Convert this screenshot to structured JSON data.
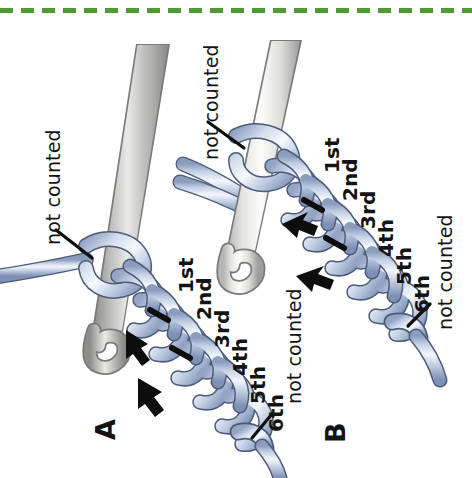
{
  "figure": {
    "kind": "crochet-instruction-illustration",
    "orientation_note": "all text rendered rotated 90 degrees counter-clockwise",
    "background_color": "#ffffff",
    "ink_color": "#131313"
  },
  "top_rule": {
    "name": "green-dashed-divider",
    "color": "#4f9b33",
    "dash_length_px": 13,
    "gap_length_px": 8,
    "y_px": 8
  },
  "palette": {
    "yarn_light": "#eef2f9",
    "yarn_mid": "#b9c6de",
    "yarn_dark": "#6d7fa2",
    "yarn_outline": "#4d5b78",
    "hook_light": "#fdfdfd",
    "hook_mid": "#d8d8d6",
    "hook_dark": "#8e8e8c",
    "hook_outline": "#7a7a78",
    "arrow": "#0d0d0d",
    "green": "#4f9b33"
  },
  "panels": [
    {
      "id": "A",
      "label": "A",
      "hook": {
        "name": "crochet-hook",
        "shade": "gray"
      },
      "not_counted_labels": [
        {
          "id": "a-top",
          "text": "not counted",
          "points_at": "loop-on-hook"
        },
        {
          "id": "a-bottom",
          "text": "not counted",
          "points_at": "slip-knot"
        }
      ],
      "stitch_labels": [
        "1st",
        "2nd",
        "3rd",
        "4th",
        "5th",
        "6th"
      ],
      "arrows": [
        {
          "id": "a-arrow-1",
          "direction": "down-left"
        },
        {
          "id": "a-arrow-2",
          "direction": "down-left"
        }
      ],
      "tick_marks": 2
    },
    {
      "id": "B",
      "label": "B",
      "hook": {
        "name": "crochet-hook",
        "shade": "white"
      },
      "not_counted_labels": [
        {
          "id": "b-top",
          "text": "not counted",
          "points_at": "loop-on-hook"
        },
        {
          "id": "b-bottom",
          "text": "not counted",
          "points_at": "slip-knot"
        }
      ],
      "stitch_labels": [
        "1st",
        "2nd",
        "3rd",
        "4th",
        "5th",
        "6th"
      ],
      "arrows": [
        {
          "id": "b-arrow-1",
          "direction": "left"
        },
        {
          "id": "b-arrow-2",
          "direction": "left"
        }
      ],
      "tick_marks": 2
    }
  ]
}
